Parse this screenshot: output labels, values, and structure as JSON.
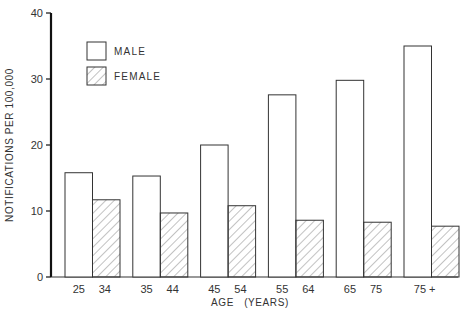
{
  "chart_data": {
    "type": "bar",
    "title": "",
    "xlabel": "AGE (YEARS)",
    "ylabel": "NOTIFICATIONS PER 100,000",
    "ylim": [
      0,
      40
    ],
    "yticks": [
      0,
      10,
      20,
      30,
      40
    ],
    "grid": false,
    "legend_position": "upper-left",
    "categories": [
      "25 - 34",
      "35 - 44",
      "45 - 54",
      "55 - 64",
      "65 - 75",
      "75 +"
    ],
    "category_labels": [
      {
        "left": "25",
        "right": "34"
      },
      {
        "left": "35",
        "right": "44"
      },
      {
        "left": "45",
        "right": "54"
      },
      {
        "left": "55",
        "right": "64"
      },
      {
        "left": "65",
        "right": "75"
      },
      {
        "left": "75 +",
        "right": ""
      }
    ],
    "series": [
      {
        "name": "MALE",
        "pattern": "open",
        "values": [
          15.8,
          15.3,
          20.0,
          27.6,
          29.8,
          35.0
        ]
      },
      {
        "name": "FEMALE",
        "pattern": "hatched",
        "values": [
          11.7,
          9.7,
          10.8,
          8.6,
          8.3,
          7.7
        ]
      }
    ]
  },
  "legend": {
    "male": "MALE",
    "female": "FEMALE"
  },
  "axes": {
    "y_title": "NOTIFICATIONS PER 100,000",
    "x_title": "AGE   (YEARS)",
    "y_ticks": [
      "0",
      "10",
      "20",
      "30",
      "40"
    ]
  },
  "colors": {
    "stroke": "#333333",
    "hatch": "#555555",
    "background": "#ffffff"
  }
}
